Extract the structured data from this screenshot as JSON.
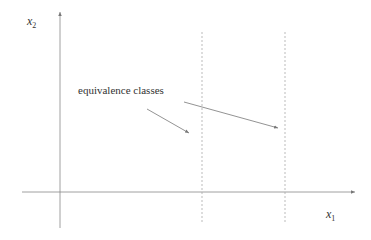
{
  "diagram": {
    "axis_x_label": "x",
    "axis_x_sub": "1",
    "axis_y_label": "x",
    "axis_y_sub": "2",
    "annotation": "equivalence classes",
    "dashed_lines_count": 2,
    "colors": {
      "axis": "#888888",
      "dashed": "#aaaaaa",
      "arrow": "#777777",
      "text": "#333333"
    }
  }
}
